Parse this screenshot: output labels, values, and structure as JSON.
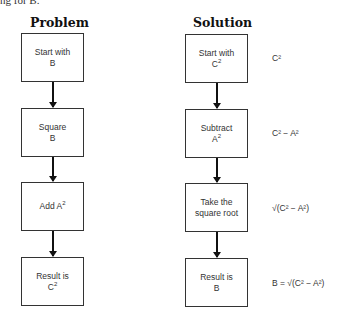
{
  "cutoff_text": "ng for B.",
  "problem": {
    "heading": "Problem",
    "steps": [
      {
        "line1": "Start with",
        "line2": "B",
        "sup": ""
      },
      {
        "line1": "Square",
        "line2": "B",
        "sup": ""
      },
      {
        "line1": "Add A",
        "line2": "",
        "sup": "2"
      },
      {
        "line1": "Result is",
        "line2": "C",
        "sup": "2"
      }
    ]
  },
  "solution": {
    "heading": "Solution",
    "steps": [
      {
        "line1": "Start with",
        "line2": "C",
        "sup": "2"
      },
      {
        "line1": "Subtract",
        "line2": "A",
        "sup": "2"
      },
      {
        "line1": "Take the",
        "line2": "square root",
        "sup": ""
      },
      {
        "line1": "Result is",
        "line2": "B",
        "sup": ""
      }
    ],
    "expressions": [
      "C²",
      "C² − A²",
      "√(C² − A²)",
      "B = √(C² − A²)"
    ]
  }
}
